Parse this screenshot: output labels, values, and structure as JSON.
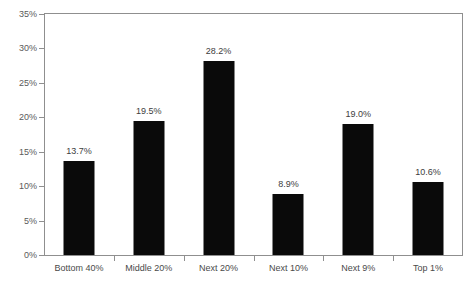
{
  "chart_data": {
    "type": "bar",
    "title": "",
    "subtitle": "",
    "xlabel": "",
    "ylabel": "",
    "categories": [
      "Bottom 40%",
      "Middle 20%",
      "Next 20%",
      "Next 10%",
      "Next 9%",
      "Top 1%"
    ],
    "values": [
      13.7,
      19.5,
      28.2,
      8.9,
      19.0,
      10.6
    ],
    "value_labels": [
      "13.7%",
      "19.5%",
      "28.2%",
      "8.9%",
      "19.0%",
      "10.6%"
    ],
    "ylim": [
      0,
      35
    ],
    "ytick_values": [
      0,
      5,
      10,
      15,
      20,
      25,
      30,
      35
    ],
    "ytick_labels": [
      "0%",
      "5%",
      "10%",
      "15%",
      "20%",
      "25%",
      "30%",
      "35%"
    ],
    "grid": false,
    "legend": null,
    "legend_position": "none",
    "bar_color": "#0a0a0a",
    "axis_color": "#8f8f8f",
    "label_color": "#4a4a4a",
    "background": "#ffffff"
  }
}
